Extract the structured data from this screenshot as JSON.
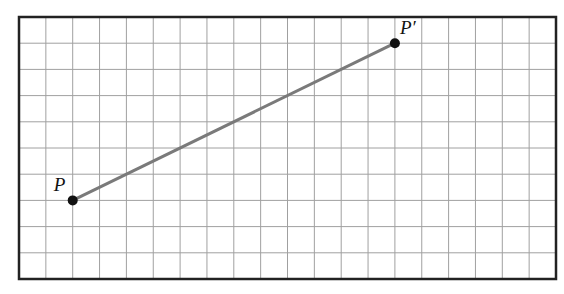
{
  "diagram": {
    "grid": {
      "columns": 20,
      "rows": 10
    },
    "points": [
      {
        "label": "P",
        "col": 2,
        "row": 7
      },
      {
        "label": "P′",
        "col": 14,
        "row": 1
      }
    ],
    "segment": {
      "from": "P",
      "to": "P′",
      "color": "#7a7a7a"
    },
    "colors": {
      "grid": "#9a9a9a",
      "border": "#222222",
      "point": "#111111"
    }
  }
}
